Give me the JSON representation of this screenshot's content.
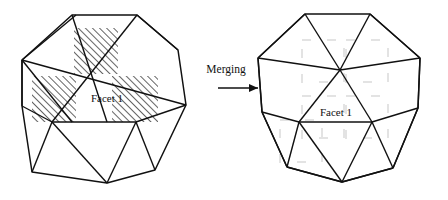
{
  "figure": {
    "background_color": "#ffffff",
    "stroke_color": "#111111",
    "hatch_color": "#4a4a4a",
    "watermark_color": "#e3e3e3"
  },
  "left_diagram": {
    "name": "polygon-before-merging",
    "facet_label": "Facet 1",
    "outline": [
      [
        72,
        15
      ],
      [
        137,
        15
      ],
      [
        178,
        50
      ],
      [
        186,
        105
      ],
      [
        155,
        170
      ],
      [
        107,
        183
      ],
      [
        32,
        172
      ],
      [
        22,
        106
      ],
      [
        22,
        60
      ]
    ],
    "hatch_patches": [
      {
        "x": 74,
        "y": 28,
        "w": 44,
        "h": 46
      },
      {
        "x": 32,
        "y": 76,
        "w": 44,
        "h": 46
      },
      {
        "x": 112,
        "y": 76,
        "w": 46,
        "h": 46
      }
    ],
    "internal_edges": [
      [
        [
          72,
          15
        ],
        [
          107,
          122
        ]
      ],
      [
        [
          137,
          15
        ],
        [
          52,
          122
        ]
      ],
      [
        [
          22,
          60
        ],
        [
          186,
          105
        ]
      ],
      [
        [
          22,
          60
        ],
        [
          76,
          15
        ]
      ],
      [
        [
          22,
          60
        ],
        [
          72,
          122
        ]
      ],
      [
        [
          22,
          106
        ],
        [
          52,
          122
        ]
      ],
      [
        [
          22,
          106
        ],
        [
          22,
          60
        ]
      ],
      [
        [
          32,
          172
        ],
        [
          52,
          122
        ]
      ],
      [
        [
          107,
          183
        ],
        [
          52,
          122
        ]
      ],
      [
        [
          107,
          183
        ],
        [
          136,
          122
        ]
      ],
      [
        [
          155,
          170
        ],
        [
          136,
          122
        ]
      ],
      [
        [
          186,
          105
        ],
        [
          136,
          122
        ]
      ],
      [
        [
          178,
          50
        ],
        [
          137,
          15
        ]
      ],
      [
        [
          52,
          122
        ],
        [
          136,
          122
        ]
      ]
    ]
  },
  "arrow": {
    "name": "merging-arrow",
    "label": "Merging",
    "label_x": 226,
    "label_y": 73,
    "line": {
      "x1": 218,
      "y1": 88,
      "x2": 258,
      "y2": 88
    },
    "head": "258,88 249,84 249,92"
  },
  "right_diagram": {
    "name": "polygon-after-merging",
    "facet_label": "Facet 1",
    "outline": [
      [
        305,
        14
      ],
      [
        370,
        14
      ],
      [
        420,
        58
      ],
      [
        418,
        108
      ],
      [
        393,
        168
      ],
      [
        342,
        182
      ],
      [
        287,
        167
      ],
      [
        262,
        112
      ],
      [
        258,
        58
      ]
    ],
    "watermark_squares": [
      {
        "x": 302,
        "y": 40,
        "w": 42,
        "h": 42
      },
      {
        "x": 346,
        "y": 40,
        "w": 42,
        "h": 42
      },
      {
        "x": 302,
        "y": 96,
        "w": 42,
        "h": 42
      },
      {
        "x": 346,
        "y": 96,
        "w": 42,
        "h": 42
      },
      {
        "x": 280,
        "y": 120,
        "w": 42,
        "h": 42
      }
    ],
    "hub_points": [
      [
        340,
        70
      ],
      [
        299,
        122
      ],
      [
        372,
        122
      ]
    ],
    "internal_edges": [
      [
        [
          305,
          14
        ],
        [
          340,
          70
        ]
      ],
      [
        [
          370,
          14
        ],
        [
          340,
          70
        ]
      ],
      [
        [
          258,
          58
        ],
        [
          340,
          70
        ]
      ],
      [
        [
          420,
          58
        ],
        [
          340,
          70
        ]
      ],
      [
        [
          258,
          58
        ],
        [
          305,
          14
        ]
      ],
      [
        [
          370,
          14
        ],
        [
          420,
          58
        ]
      ],
      [
        [
          258,
          58
        ],
        [
          262,
          112
        ]
      ],
      [
        [
          420,
          58
        ],
        [
          418,
          108
        ]
      ],
      [
        [
          262,
          112
        ],
        [
          299,
          122
        ]
      ],
      [
        [
          418,
          108
        ],
        [
          372,
          122
        ]
      ],
      [
        [
          340,
          70
        ],
        [
          299,
          122
        ]
      ],
      [
        [
          340,
          70
        ],
        [
          372,
          122
        ]
      ],
      [
        [
          299,
          122
        ],
        [
          372,
          122
        ]
      ],
      [
        [
          287,
          167
        ],
        [
          299,
          122
        ]
      ],
      [
        [
          287,
          167
        ],
        [
          262,
          112
        ]
      ],
      [
        [
          342,
          182
        ],
        [
          299,
          122
        ]
      ],
      [
        [
          342,
          182
        ],
        [
          372,
          122
        ]
      ],
      [
        [
          342,
          182
        ],
        [
          287,
          167
        ]
      ],
      [
        [
          393,
          168
        ],
        [
          372,
          122
        ]
      ],
      [
        [
          393,
          168
        ],
        [
          418,
          108
        ]
      ],
      [
        [
          393,
          168
        ],
        [
          342,
          182
        ]
      ]
    ]
  }
}
